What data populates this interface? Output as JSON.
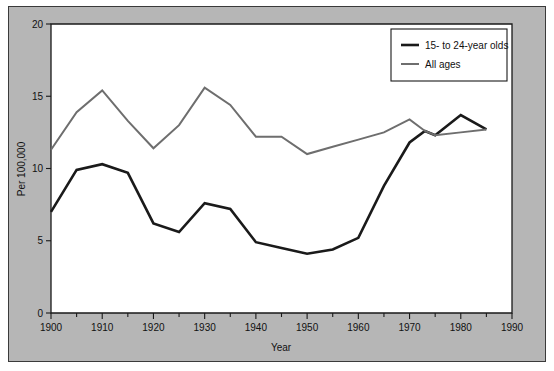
{
  "figure": {
    "panel_color": "#b6b6b6",
    "plot_color": "#ffffff",
    "border_color": "#3a3a3a"
  },
  "legend": {
    "position": "top-right",
    "entries": [
      {
        "label": "15- to 24-year olds",
        "color": "#1a1a1a",
        "width": 2.6
      },
      {
        "label": "All ages",
        "color": "#6e6e6e",
        "width": 2.0
      }
    ]
  },
  "axes": {
    "x": {
      "label": "Year",
      "min": 1900,
      "max": 1990,
      "major_ticks": [
        1900,
        1910,
        1920,
        1930,
        1940,
        1950,
        1960,
        1970,
        1980,
        1990
      ],
      "minor_step": 5,
      "tick_labels": [
        "1900",
        "1910",
        "1920",
        "1930",
        "1940",
        "1950",
        "1960",
        "1970",
        "1980",
        "1990"
      ]
    },
    "y": {
      "label": "Per 100,000",
      "min": 0,
      "max": 20,
      "major_ticks": [
        0,
        5,
        10,
        15,
        20
      ],
      "tick_labels": [
        "0",
        "5",
        "10",
        "15",
        "20"
      ]
    }
  },
  "chart_data": {
    "type": "line",
    "title": "",
    "subtitle": "",
    "xlabel": "Year",
    "ylabel": "Per 100,000",
    "xlim": [
      1900,
      1990
    ],
    "ylim": [
      0,
      20
    ],
    "grid": false,
    "legend_position": "top-right",
    "x": [
      1900,
      1905,
      1910,
      1915,
      1920,
      1925,
      1930,
      1935,
      1940,
      1945,
      1950,
      1955,
      1960,
      1965,
      1970,
      1973,
      1975,
      1980,
      1985
    ],
    "series": [
      {
        "name": "15- to 24-year olds",
        "color": "#1a1a1a",
        "values": [
          7.0,
          9.9,
          10.3,
          9.7,
          6.2,
          5.6,
          7.6,
          7.2,
          4.9,
          4.5,
          4.1,
          4.4,
          5.2,
          8.8,
          11.8,
          12.6,
          12.3,
          13.7,
          12.7
        ]
      },
      {
        "name": "All ages",
        "color": "#6e6e6e",
        "values": [
          11.3,
          13.9,
          15.4,
          13.3,
          11.4,
          13.0,
          15.6,
          14.4,
          12.2,
          12.2,
          11.0,
          11.5,
          12.0,
          12.5,
          13.4,
          12.6,
          12.3,
          12.5,
          12.7
        ]
      }
    ]
  }
}
